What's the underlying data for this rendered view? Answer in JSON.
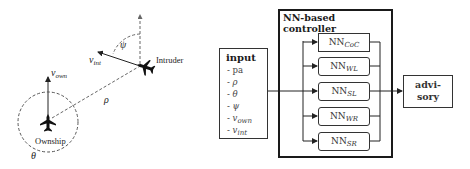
{
  "geometry": {
    "ownship_label": "Ownship",
    "intruder_label": "Intruder",
    "v_own": {
      "base": "v",
      "sub": "own"
    },
    "v_int": {
      "base": "v",
      "sub": "int"
    },
    "rho": "ρ",
    "theta": "θ",
    "psi": "ψ"
  },
  "input": {
    "title": "input",
    "items": [
      {
        "prefix": "- ",
        "base": "pa",
        "sub": ""
      },
      {
        "prefix": "- ",
        "base": "ρ",
        "sub": ""
      },
      {
        "prefix": "- ",
        "base": "θ",
        "sub": ""
      },
      {
        "prefix": "- ",
        "base": "ψ",
        "sub": ""
      },
      {
        "prefix": "- ",
        "base": "v",
        "sub": "own"
      },
      {
        "prefix": "- ",
        "base": "v",
        "sub": "int"
      }
    ]
  },
  "controller": {
    "title": "NN-based controller",
    "networks": [
      {
        "base": "NN",
        "sub": "CoC"
      },
      {
        "base": "NN",
        "sub": "WL"
      },
      {
        "base": "NN",
        "sub": "SL"
      },
      {
        "base": "NN",
        "sub": "WR"
      },
      {
        "base": "NN",
        "sub": "SR"
      }
    ]
  },
  "output": {
    "line1": "advi-",
    "line2": "sory"
  }
}
